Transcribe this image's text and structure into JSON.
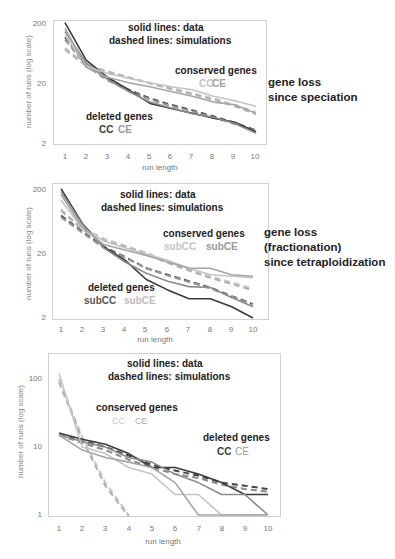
{
  "colors": {
    "cc_deleted": "#3a3a3a",
    "ce_deleted": "#8c8c8c",
    "cc_conserved": "#bdbdbd",
    "ce_conserved": "#a3a3a3",
    "frame": "#d0d0d0",
    "axis_text": "#777777"
  },
  "chart_data": [
    {
      "type": "line",
      "title": "",
      "annotation_lines": [
        "solid lines:  data",
        "dashed lines: simulations"
      ],
      "side_label": [
        "gene loss",
        "since speciation"
      ],
      "xlabel": "run length",
      "ylabel": "number of runs (log scale)",
      "yscale": "log",
      "ylim": [
        2,
        200
      ],
      "yticks": [
        "200",
        "20",
        "2"
      ],
      "x": [
        1,
        2,
        3,
        4,
        5,
        6,
        7,
        8,
        9,
        10
      ],
      "legend_groups": [
        {
          "title": "conserved genes",
          "items": [
            "CC",
            "CE"
          ]
        },
        {
          "title": "deleted genes",
          "items": [
            "CC",
            "CE"
          ]
        }
      ],
      "series": [
        {
          "name": "deleted CC data",
          "style": "solid",
          "color": "#3a3a3a",
          "values": [
            210,
            50,
            26,
            16,
            9.5,
            7.8,
            6.5,
            5.4,
            4.6,
            3.2
          ]
        },
        {
          "name": "deleted CE data",
          "style": "solid",
          "color": "#8c8c8c",
          "values": [
            150,
            45,
            24,
            15,
            10,
            8,
            6.4,
            5.6,
            4.4,
            3.0
          ]
        },
        {
          "name": "deleted CC sim",
          "style": "dashed",
          "color": "#555555",
          "values": [
            120,
            42,
            24,
            16,
            11.5,
            9,
            7.3,
            5.8,
            4.5,
            3.4
          ]
        },
        {
          "name": "deleted CE sim",
          "style": "dashed",
          "color": "#9a9a9a",
          "values": [
            110,
            40,
            23,
            15.5,
            11,
            8.6,
            7,
            5.5,
            4.3,
            3.3
          ]
        },
        {
          "name": "conserved CC data",
          "style": "solid",
          "color": "#c4c4c4",
          "values": [
            130,
            40,
            30,
            25,
            21,
            18,
            16,
            12.5,
            10.5,
            8.5
          ]
        },
        {
          "name": "conserved CE data",
          "style": "solid",
          "color": "#a5a5a5",
          "values": [
            170,
            38,
            26,
            21,
            18,
            15,
            12.5,
            10,
            9,
            6.5
          ]
        },
        {
          "name": "conserved CC sim",
          "style": "dashed",
          "color": "#c8c8c8",
          "values": [
            80,
            42,
            33,
            26,
            21,
            17,
            14,
            11.5,
            9,
            6.8
          ]
        },
        {
          "name": "conserved CE sim",
          "style": "dashed",
          "color": "#b0b0b0",
          "values": [
            75,
            40,
            32,
            25.5,
            20.5,
            16.5,
            13.5,
            11,
            8.5,
            6.3
          ]
        }
      ]
    },
    {
      "type": "line",
      "title": "",
      "annotation_lines": [
        "solid lines:  data",
        "dashed lines: simulations"
      ],
      "side_label": [
        "gene loss",
        "(fractionation)",
        "since tetraploidization"
      ],
      "xlabel": "run length",
      "ylabel": "number of runs (log scale)",
      "yscale": "log",
      "ylim": [
        2,
        200
      ],
      "yticks": [
        "200",
        "20",
        "2"
      ],
      "x": [
        1,
        2,
        3,
        4,
        5,
        6,
        7,
        8,
        9,
        10
      ],
      "legend_groups": [
        {
          "title": "conserved genes",
          "items": [
            "subCC",
            "subCE"
          ]
        },
        {
          "title": "deleted genes",
          "items": [
            "subCC",
            "subCE"
          ]
        }
      ],
      "series": [
        {
          "name": "deleted subCC data",
          "style": "solid",
          "color": "#3a3a3a",
          "values": [
            210,
            60,
            26,
            16,
            8,
            5.5,
            4,
            4,
            3,
            2
          ]
        },
        {
          "name": "deleted subCE data",
          "style": "solid",
          "color": "#8c8c8c",
          "values": [
            190,
            58,
            25,
            15,
            10,
            7.5,
            6.2,
            6,
            4.2,
            3
          ]
        },
        {
          "name": "deleted subCC sim",
          "style": "dashed",
          "color": "#555555",
          "values": [
            80,
            45,
            26,
            18,
            12,
            9.5,
            7.5,
            6,
            4.4,
            3.3
          ]
        },
        {
          "name": "deleted subCE sim",
          "style": "dashed",
          "color": "#9a9a9a",
          "values": [
            75,
            43,
            25,
            17.5,
            12,
            9.2,
            7.3,
            5.8,
            4.3,
            3.2
          ]
        },
        {
          "name": "conserved subCC data",
          "style": "solid",
          "color": "#c4c4c4",
          "values": [
            140,
            50,
            32,
            25,
            20,
            16,
            12,
            9.5,
            9,
            8.5
          ]
        },
        {
          "name": "conserved subCE data",
          "style": "solid",
          "color": "#a5a5a5",
          "values": [
            170,
            52,
            28,
            23,
            19,
            15,
            12,
            12,
            9.5,
            9
          ]
        },
        {
          "name": "conserved subCC sim",
          "style": "dashed",
          "color": "#c8c8c8",
          "values": [
            100,
            50,
            35,
            27,
            21,
            15,
            11.5,
            9,
            7.2,
            5.8
          ]
        },
        {
          "name": "conserved subCE sim",
          "style": "dashed",
          "color": "#b0b0b0",
          "values": [
            95,
            48,
            33,
            26,
            20,
            14.5,
            11,
            8.5,
            6.8,
            5.4
          ]
        }
      ]
    },
    {
      "type": "line",
      "title": "",
      "annotation_lines": [
        "solid lines:  data",
        "dashed lines: simulations"
      ],
      "side_label": [],
      "xlabel": "run length",
      "ylabel": "number of runs (log scale)",
      "yscale": "log",
      "ylim": [
        1,
        200
      ],
      "yticks": [
        "100",
        "10",
        "1"
      ],
      "x": [
        1,
        2,
        3,
        4,
        5,
        6,
        7,
        8,
        9,
        10
      ],
      "legend_groups": [
        {
          "title": "conserved genes",
          "items": [
            "CC",
            "CE"
          ]
        },
        {
          "title": "deleted genes",
          "items": [
            "CC",
            "CE"
          ]
        }
      ],
      "series": [
        {
          "name": "deleted CC data",
          "style": "solid",
          "color": "#3a3a3a",
          "values": [
            16,
            13,
            11,
            8,
            5,
            5,
            4,
            3,
            2,
            2
          ]
        },
        {
          "name": "deleted CE data",
          "style": "solid",
          "color": "#8c8c8c",
          "values": [
            15,
            12,
            10,
            7,
            6,
            4,
            3,
            2,
            2,
            1
          ]
        },
        {
          "name": "deleted CC sim",
          "style": "dashed",
          "color": "#444444",
          "values": [
            15,
            12.5,
            10,
            7.5,
            5.5,
            4.5,
            3.8,
            3,
            2.7,
            2.4
          ]
        },
        {
          "name": "deleted CE sim",
          "style": "dashed",
          "color": "#8a8a8a",
          "values": [
            15,
            11.5,
            9,
            6.5,
            5,
            4,
            3.5,
            2.8,
            2.4,
            2.2
          ]
        },
        {
          "name": "conserved CC data",
          "style": "solid",
          "color": "#c4c4c4",
          "values": [
            120,
            10,
            8,
            5,
            4,
            2,
            2,
            1,
            1,
            1
          ]
        },
        {
          "name": "conserved CE data",
          "style": "solid",
          "color": "#a5a5a5",
          "values": [
            15,
            9,
            7,
            6,
            5,
            3,
            1,
            1,
            1,
            1
          ]
        },
        {
          "name": "conserved CC sim",
          "style": "dashed",
          "color": "#c8c8c8",
          "values": [
            100,
            14,
            3,
            1
          ]
        },
        {
          "name": "conserved CE sim",
          "style": "dashed",
          "color": "#b0b0b0",
          "values": [
            90,
            13,
            2.7,
            0.95
          ]
        }
      ]
    }
  ],
  "charts": [
    {
      "anno1": "solid lines:  data",
      "anno2": "dashed lines: simulations",
      "conserved_title": "conserved genes",
      "conserved_cc": "CC",
      "conserved_ce": "CE",
      "deleted_title": "deleted genes",
      "deleted_cc": "CC",
      "deleted_ce": "CE",
      "yticks": [
        "200",
        "20",
        "2"
      ],
      "xticks": [
        "1",
        "2",
        "3",
        "4",
        "5",
        "6",
        "7",
        "8",
        "9",
        "10"
      ],
      "xlabel": "run length",
      "ylabel": "number of runs (log scale)",
      "side": [
        "gene loss",
        "since speciation"
      ]
    },
    {
      "anno1": "solid lines:  data",
      "anno2": "dashed lines: simulations",
      "conserved_title": "conserved genes",
      "conserved_cc": "subCC",
      "conserved_ce": "subCE",
      "deleted_title": "deleted genes",
      "deleted_cc": "subCC",
      "deleted_ce": "subCE",
      "yticks": [
        "200",
        "20",
        "2"
      ],
      "xticks": [
        "1",
        "2",
        "3",
        "4",
        "5",
        "6",
        "7",
        "8",
        "9",
        "10"
      ],
      "xlabel": "run length",
      "ylabel": "number of runs (log scale)",
      "side": [
        "gene loss",
        "(fractionation)",
        "since tetraploidization"
      ]
    },
    {
      "anno1": "solid lines:  data",
      "anno2": "dashed lines: simulations",
      "conserved_title": "conserved genes",
      "conserved_cc": "CC",
      "conserved_ce": "CE",
      "deleted_title": "deleted genes",
      "deleted_cc": "CC",
      "deleted_ce": "CE",
      "yticks": [
        "100",
        "10",
        "1"
      ],
      "xticks": [
        "1",
        "2",
        "3",
        "4",
        "5",
        "6",
        "7",
        "8",
        "9",
        "10"
      ],
      "xlabel": "run length",
      "ylabel": "number of runs (log scale)"
    }
  ]
}
